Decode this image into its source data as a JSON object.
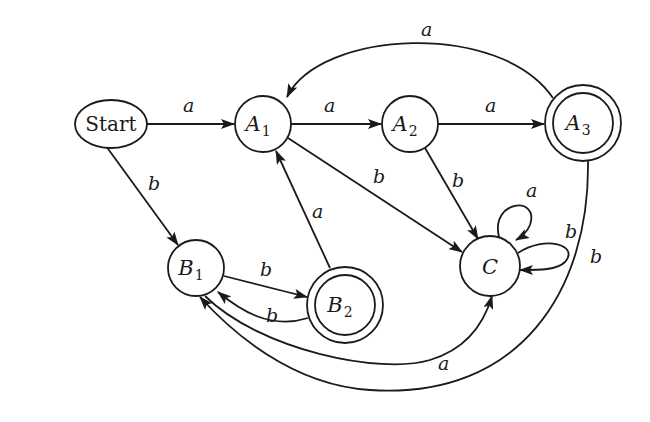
{
  "diagram": {
    "type": "finite-automaton",
    "start_label": "Start",
    "states": [
      {
        "id": "A1",
        "base": "A",
        "sub": "1",
        "accepting": false
      },
      {
        "id": "A2",
        "base": "A",
        "sub": "2",
        "accepting": false
      },
      {
        "id": "A3",
        "base": "A",
        "sub": "3",
        "accepting": true
      },
      {
        "id": "B1",
        "base": "B",
        "sub": "1",
        "accepting": false
      },
      {
        "id": "B2",
        "base": "B",
        "sub": "2",
        "accepting": true
      },
      {
        "id": "C",
        "base": "C",
        "sub": "",
        "accepting": false
      }
    ],
    "transitions": [
      {
        "from": "Start",
        "to": "A1",
        "symbol": "a"
      },
      {
        "from": "Start",
        "to": "B1",
        "symbol": "b"
      },
      {
        "from": "A1",
        "to": "A2",
        "symbol": "a"
      },
      {
        "from": "A1",
        "to": "C",
        "symbol": "b"
      },
      {
        "from": "A2",
        "to": "A3",
        "symbol": "a"
      },
      {
        "from": "A2",
        "to": "C",
        "symbol": "b"
      },
      {
        "from": "A3",
        "to": "A1",
        "symbol": "a"
      },
      {
        "from": "A3",
        "to": "B1",
        "symbol": "b"
      },
      {
        "from": "B1",
        "to": "B2",
        "symbol": "b"
      },
      {
        "from": "B1",
        "to": "C",
        "symbol": "a"
      },
      {
        "from": "B2",
        "to": "B1",
        "symbol": "b"
      },
      {
        "from": "B2",
        "to": "A1",
        "symbol": "a"
      },
      {
        "from": "C",
        "to": "C",
        "symbol": "a"
      },
      {
        "from": "C",
        "to": "C",
        "symbol": "b"
      }
    ]
  }
}
